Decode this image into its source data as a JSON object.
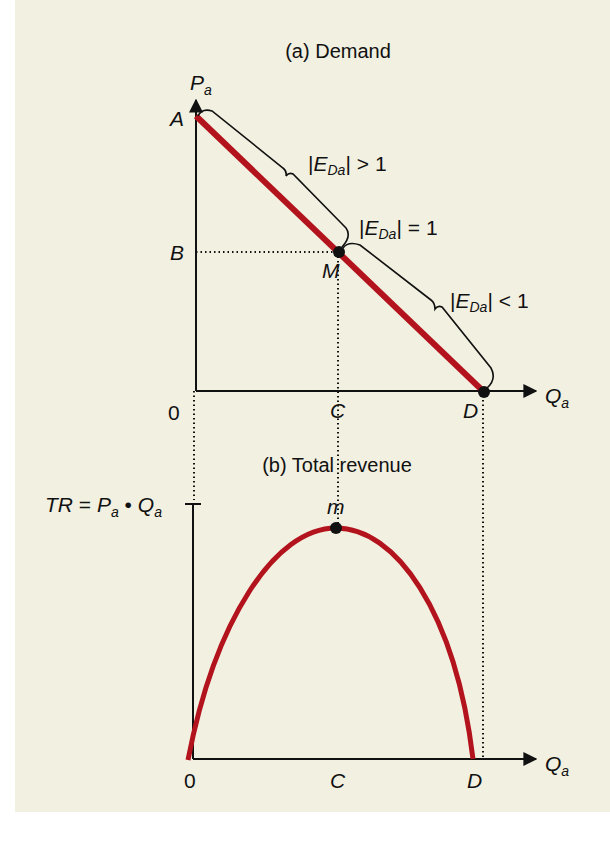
{
  "figure": {
    "panel_a": {
      "title": "(a) Demand",
      "y_axis_label": {
        "main": "P",
        "sub": "a"
      },
      "x_axis_label": {
        "main": "Q",
        "sub": "a"
      },
      "points": {
        "A": "A",
        "B": "B",
        "M": "M",
        "C": "C",
        "D": "D",
        "origin": "0"
      },
      "elasticity_labels": {
        "upper": {
          "bar_l": "|",
          "E": "E",
          "sub": "Da",
          "bar_r": "|",
          "rel": "> 1"
        },
        "middle": {
          "bar_l": "|",
          "E": "E",
          "sub": "Da",
          "bar_r": "|",
          "rel": "= 1"
        },
        "lower": {
          "bar_l": "|",
          "E": "E",
          "sub": "Da",
          "bar_r": "|",
          "rel": "< 1"
        }
      }
    },
    "panel_b": {
      "title": "(b) Total revenue",
      "y_axis_label": {
        "TR": "TR",
        "eq": " = ",
        "P": "P",
        "Psub": "a",
        "dot": " • ",
        "Q": "Q",
        "Qsub": "a"
      },
      "x_axis_label": {
        "main": "Q",
        "sub": "a"
      },
      "points": {
        "m": "m",
        "origin": "0",
        "C": "C",
        "D": "D"
      }
    },
    "colors": {
      "curve": "#b3131c",
      "ink": "#111111",
      "background": "#f2f0e1"
    }
  }
}
